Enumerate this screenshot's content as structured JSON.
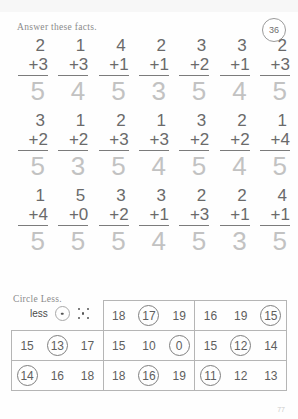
{
  "header": {
    "instruction": "Answer these facts.",
    "badge": "36"
  },
  "facts": {
    "rows": [
      [
        {
          "top": "2",
          "bottom": "+3",
          "answer": "5"
        },
        {
          "top": "1",
          "bottom": "+3",
          "answer": "4"
        },
        {
          "top": "4",
          "bottom": "+1",
          "answer": "5"
        },
        {
          "top": "2",
          "bottom": "+1",
          "answer": "3"
        },
        {
          "top": "3",
          "bottom": "+2",
          "answer": "5"
        },
        {
          "top": "3",
          "bottom": "+1",
          "answer": "4"
        },
        {
          "top": "2",
          "bottom": "+3",
          "answer": "5"
        }
      ],
      [
        {
          "top": "3",
          "bottom": "+2",
          "answer": "5"
        },
        {
          "top": "1",
          "bottom": "+2",
          "answer": "3"
        },
        {
          "top": "2",
          "bottom": "+3",
          "answer": "5"
        },
        {
          "top": "1",
          "bottom": "+3",
          "answer": "4"
        },
        {
          "top": "3",
          "bottom": "+2",
          "answer": "5"
        },
        {
          "top": "2",
          "bottom": "+2",
          "answer": "4"
        },
        {
          "top": "1",
          "bottom": "+4",
          "answer": "5"
        }
      ],
      [
        {
          "top": "1",
          "bottom": "+4",
          "answer": "5"
        },
        {
          "top": "5",
          "bottom": "+0",
          "answer": "5"
        },
        {
          "top": "3",
          "bottom": "+2",
          "answer": "5"
        },
        {
          "top": "3",
          "bottom": "+1",
          "answer": "4"
        },
        {
          "top": "2",
          "bottom": "+3",
          "answer": "5"
        },
        {
          "top": "2",
          "bottom": "+1",
          "answer": "3"
        },
        {
          "top": "4",
          "bottom": "+1",
          "answer": "5"
        }
      ]
    ]
  },
  "circle_less": {
    "instruction": "Circle Less.",
    "legend": {
      "word": "less",
      "die_one_name": "die-face-one",
      "die_five_name": "die-face-five"
    },
    "rows": [
      [
        null,
        [
          {
            "value": "18",
            "circled": false
          },
          {
            "value": "17",
            "circled": true
          },
          {
            "value": "19",
            "circled": false
          }
        ],
        [
          {
            "value": "16",
            "circled": false
          },
          {
            "value": "19",
            "circled": false
          },
          {
            "value": "15",
            "circled": true
          }
        ]
      ],
      [
        [
          {
            "value": "15",
            "circled": false
          },
          {
            "value": "13",
            "circled": true
          },
          {
            "value": "17",
            "circled": false
          }
        ],
        [
          {
            "value": "15",
            "circled": false
          },
          {
            "value": "10",
            "circled": false
          },
          {
            "value": "0",
            "circled": true
          }
        ],
        [
          {
            "value": "15",
            "circled": false
          },
          {
            "value": "12",
            "circled": true
          },
          {
            "value": "14",
            "circled": false
          }
        ]
      ],
      [
        [
          {
            "value": "14",
            "circled": true
          },
          {
            "value": "16",
            "circled": false
          },
          {
            "value": "18",
            "circled": false
          }
        ],
        [
          {
            "value": "18",
            "circled": false
          },
          {
            "value": "16",
            "circled": true
          },
          {
            "value": "19",
            "circled": false
          }
        ],
        [
          {
            "value": "11",
            "circled": true
          },
          {
            "value": "12",
            "circled": false
          },
          {
            "value": "13",
            "circled": false
          }
        ]
      ]
    ]
  },
  "footer": {
    "page_number": "77"
  },
  "colors": {
    "ink": "#6a6a6a",
    "answer_ink": "#c2c2c2",
    "rule": "#7b7b7b",
    "border": "#b5b5b5"
  }
}
